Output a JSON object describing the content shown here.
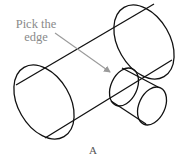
{
  "diagram": {
    "callout": {
      "line1": "Pick the",
      "line2": "edge"
    },
    "caption": "A",
    "colors": {
      "stroke": "#111111",
      "arrow": "#9a9a9a",
      "callout_text": "#8a8a8a"
    },
    "shapes": [
      {
        "name": "large-cylinder",
        "type": "cylinder"
      },
      {
        "name": "small-cylinder",
        "type": "cylinder"
      }
    ]
  }
}
